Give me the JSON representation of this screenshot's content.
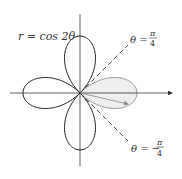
{
  "diagram": {
    "equation_label": "r = cos 2θ",
    "line_pos": {
      "theta": "θ =",
      "num": "π",
      "den": "4"
    },
    "line_neg": {
      "theta": "θ = −",
      "num": "π",
      "den": "4"
    },
    "colors": {
      "curve": "#222222",
      "shaded_fill": "#eeeeee",
      "shaded_stroke": "#999999",
      "axis": "#333333"
    }
  }
}
